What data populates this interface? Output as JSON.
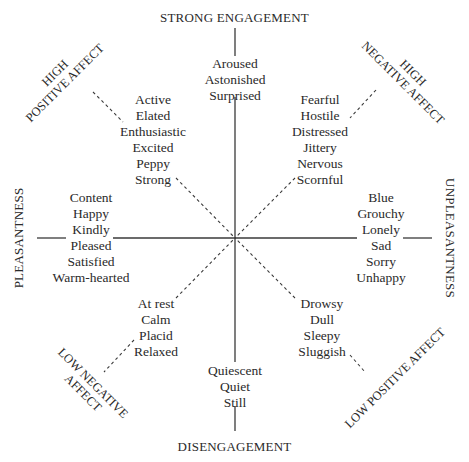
{
  "axes": {
    "top": "STRONG ENGAGEMENT",
    "bottom": "DISENGAGEMENT",
    "left": "PLEASANTNESS",
    "right": "UNPLEASANTNESS"
  },
  "diagonals": {
    "top_left": [
      "HIGH",
      "POSITIVE AFFECT"
    ],
    "top_right": [
      "HIGH",
      "NEGATIVE AFFECT"
    ],
    "bottom_left": [
      "LOW NEGATIVE",
      "AFFECT"
    ],
    "bottom_right": [
      "LOW POSITIVE AFFECT"
    ]
  },
  "clusters": {
    "strong_engagement": [
      "Aroused",
      "Astonished",
      "Surprised"
    ],
    "high_positive_affect": [
      "Active",
      "Elated",
      "Enthusiastic",
      "Excited",
      "Peppy",
      "Strong"
    ],
    "high_negative_affect": [
      "Fearful",
      "Hostile",
      "Distressed",
      "Jittery",
      "Nervous",
      "Scornful"
    ],
    "pleasantness": [
      "Content",
      "Happy",
      "Kindly",
      "Pleased",
      "Satisfied",
      "Warm-hearted"
    ],
    "unpleasantness": [
      "Blue",
      "Grouchy",
      "Lonely",
      "Sad",
      "Sorry",
      "Unhappy"
    ],
    "low_negative_affect": [
      "At rest",
      "Calm",
      "Placid",
      "Relaxed"
    ],
    "low_positive_affect": [
      "Drowsy",
      "Dull",
      "Sleepy",
      "Sluggish"
    ],
    "disengagement": [
      "Quiescent",
      "Quiet",
      "Still"
    ]
  }
}
